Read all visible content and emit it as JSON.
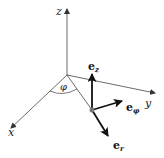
{
  "diagram": {
    "axes": {
      "x": {
        "label": "x"
      },
      "y": {
        "label": "y"
      },
      "z": {
        "label": "z"
      }
    },
    "angle": {
      "label": "φ"
    },
    "vectors": [
      {
        "name": "e_z",
        "base": "e",
        "subscript": "z"
      },
      {
        "name": "e_phi",
        "base": "e",
        "subscript": "φ"
      },
      {
        "name": "e_r",
        "base": "e",
        "subscript": "r"
      }
    ],
    "colors": {
      "axis": "#444444",
      "vector": "#111111",
      "point": "#777777"
    }
  }
}
